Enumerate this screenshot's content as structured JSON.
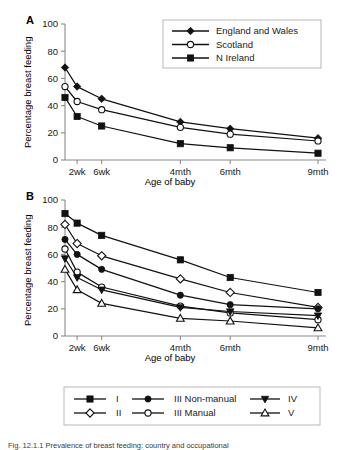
{
  "figure": {
    "caption": "Fig. 12.1.1   Prevalence of breast feeding: country and occupational",
    "panels": [
      {
        "letter": "A",
        "ylabel": "Percentage breast feeding",
        "xlabel": "Age of baby"
      },
      {
        "letter": "B",
        "ylabel": "Percentage breast feeding",
        "xlabel": "Age of baby"
      }
    ]
  },
  "axis": {
    "yticks": [
      "0",
      "20",
      "40",
      "60",
      "80",
      "100"
    ],
    "xticks": [
      "2wk",
      "6wk",
      "4mth",
      "6mth",
      "9mth"
    ]
  },
  "legendA": {
    "items": [
      {
        "label": "England and Wales",
        "marker": "filled-diamond-icon"
      },
      {
        "label": "Scotland",
        "marker": "open-circle-icon"
      },
      {
        "label": "N Ireland",
        "marker": "filled-square-icon"
      }
    ]
  },
  "legendB": {
    "items": [
      {
        "label": "I",
        "marker": "filled-square-icon"
      },
      {
        "label": "II",
        "marker": "open-diamond-icon"
      },
      {
        "label": "III Non-manual",
        "marker": "filled-circle-icon"
      },
      {
        "label": "III Manual",
        "marker": "open-circle-icon"
      },
      {
        "label": "IV",
        "marker": "filled-triangle-down-icon"
      },
      {
        "label": "V",
        "marker": "open-triangle-up-icon"
      }
    ]
  },
  "chart_data": [
    {
      "type": "line",
      "panel": "A",
      "title": "",
      "xlabel": "Age of baby",
      "ylabel": "Percentage breast feeding",
      "ylim": [
        0,
        100
      ],
      "grid": false,
      "legend_position": "top-right",
      "x": [
        "Birth",
        "2wk",
        "6wk",
        "4mth",
        "6mth",
        "9mth"
      ],
      "xtick_labels": [
        "",
        "2wk",
        "6wk",
        "4mth",
        "6mth",
        "9mth"
      ],
      "series": [
        {
          "name": "England and Wales",
          "marker": "filled-diamond",
          "values": [
            68,
            54,
            45,
            28,
            23,
            16
          ]
        },
        {
          "name": "Scotland",
          "marker": "open-circle",
          "values": [
            54,
            43,
            37,
            24,
            19,
            14
          ]
        },
        {
          "name": "N Ireland",
          "marker": "filled-square",
          "values": [
            46,
            32,
            25,
            12,
            9,
            5
          ]
        }
      ]
    },
    {
      "type": "line",
      "panel": "B",
      "title": "",
      "xlabel": "Age of baby",
      "ylabel": "Percentage breast feeding",
      "ylim": [
        0,
        100
      ],
      "grid": false,
      "legend_position": "bottom",
      "x": [
        "Birth",
        "2wk",
        "6wk",
        "4mth",
        "6mth",
        "9mth"
      ],
      "xtick_labels": [
        "",
        "2wk",
        "6wk",
        "4mth",
        "6mth",
        "9mth"
      ],
      "series": [
        {
          "name": "I",
          "marker": "filled-square",
          "values": [
            90,
            83,
            74,
            56,
            43,
            32
          ]
        },
        {
          "name": "II",
          "marker": "open-diamond",
          "values": [
            82,
            68,
            59,
            42,
            32,
            21
          ]
        },
        {
          "name": "III Non-manual",
          "marker": "filled-circle",
          "values": [
            71,
            60,
            49,
            30,
            23,
            20
          ]
        },
        {
          "name": "III Manual",
          "marker": "open-circle",
          "values": [
            64,
            47,
            36,
            22,
            17,
            12
          ]
        },
        {
          "name": "IV",
          "marker": "filled-triangle-down",
          "values": [
            57,
            43,
            34,
            21,
            18,
            15
          ]
        },
        {
          "name": "V",
          "marker": "open-triangle-up",
          "values": [
            49,
            34,
            24,
            13,
            11,
            6
          ]
        }
      ]
    }
  ]
}
